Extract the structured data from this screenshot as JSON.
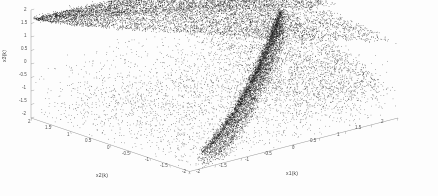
{
  "figure": {
    "background_color": "#fdfdfd",
    "point_color": "#1a1a1a",
    "axis_color": "#8a8a8a"
  },
  "labels": {
    "z_axis": "x3(k)",
    "x_axis_left": "x2(k)",
    "x_axis_right": "x1(k)"
  },
  "chart_data": {
    "type": "scatter",
    "title": "",
    "xlabel": "x1(k)",
    "ylabel": "x2(k)",
    "zlabel": "x3(k)",
    "projection": "3d",
    "grid": false,
    "legend": null,
    "xlim": [
      -2,
      2
    ],
    "ylim": [
      -2,
      2
    ],
    "zlim": [
      -2,
      2
    ],
    "xticks": [
      -2,
      -1.5,
      -1,
      -0.5,
      0,
      0.5,
      1,
      1.5,
      2
    ],
    "yticks": [
      -2,
      -1.5,
      -1,
      -0.5,
      0,
      0.5,
      1,
      1.5,
      2
    ],
    "zticks": [
      -2,
      -1.5,
      -1,
      -0.5,
      0,
      0.5,
      1,
      1.5,
      2
    ],
    "xticklabels": [
      "-2",
      "-1.5",
      "-1",
      "-0.5",
      "0",
      "0.5",
      "1",
      "1.5",
      "2"
    ],
    "yticklabels": [
      "2",
      "1.5",
      "1",
      "0.5",
      "0",
      "-0.5",
      "-1",
      "-1.5",
      "-2"
    ],
    "zticklabels": [
      "2",
      "1.5",
      "1",
      "0.5",
      "0",
      "-0.5",
      "-1",
      "-1.5",
      "-2"
    ],
    "marker": ".",
    "marker_size": 1,
    "n_points": 12000,
    "clusters": [
      {
        "name": "upper-sheet",
        "density": "very-high",
        "x_range": [
          -2,
          2
        ],
        "y_range": [
          -2,
          2
        ],
        "z_range": [
          0.4,
          1.85
        ],
        "n_points": 5200
      },
      {
        "name": "lower-ridge",
        "density": "high",
        "x_range": [
          -1.6,
          2
        ],
        "y_range": [
          -2,
          1.2
        ],
        "z_range": [
          -1.6,
          0.6
        ],
        "n_points": 4200
      },
      {
        "name": "sparse-basin",
        "density": "low",
        "x_range": [
          -2,
          2
        ],
        "y_range": [
          -2,
          2
        ],
        "z_range": [
          -2,
          -0.2
        ],
        "n_points": 2600
      }
    ]
  },
  "z_ticks_render": [
    {
      "label": "2",
      "x": 24,
      "y": 7
    },
    {
      "label": "1.5",
      "x": 21,
      "y": 20
    },
    {
      "label": "1",
      "x": 24,
      "y": 33
    },
    {
      "label": "0.5",
      "x": 21,
      "y": 46
    },
    {
      "label": "0",
      "x": 24,
      "y": 59
    },
    {
      "label": "-0.5",
      "x": 19,
      "y": 72
    },
    {
      "label": "-1",
      "x": 22,
      "y": 85
    },
    {
      "label": "-1.5",
      "x": 19,
      "y": 98
    },
    {
      "label": "-2",
      "x": 22,
      "y": 111
    }
  ],
  "y_ticks_render": [
    {
      "label": "2",
      "x": 28,
      "y": 119
    },
    {
      "label": "1.5",
      "x": 45,
      "y": 125
    },
    {
      "label": "1",
      "x": 67,
      "y": 132
    },
    {
      "label": "0.5",
      "x": 85,
      "y": 138
    },
    {
      "label": "0",
      "x": 107,
      "y": 145
    },
    {
      "label": "-0.5",
      "x": 122,
      "y": 151
    },
    {
      "label": "-1",
      "x": 145,
      "y": 157
    },
    {
      "label": "-1.5",
      "x": 160,
      "y": 163
    },
    {
      "label": "-2",
      "x": 182,
      "y": 169
    }
  ],
  "x_ticks_render": [
    {
      "label": "-2",
      "x": 196,
      "y": 169
    },
    {
      "label": "-1.5",
      "x": 219,
      "y": 163
    },
    {
      "label": "-1",
      "x": 245,
      "y": 157
    },
    {
      "label": "-0.5",
      "x": 264,
      "y": 151
    },
    {
      "label": "0",
      "x": 292,
      "y": 145
    },
    {
      "label": "0.5",
      "x": 310,
      "y": 138
    },
    {
      "label": "1",
      "x": 337,
      "y": 132
    },
    {
      "label": "1.5",
      "x": 355,
      "y": 125
    },
    {
      "label": "2",
      "x": 381,
      "y": 119
    }
  ]
}
